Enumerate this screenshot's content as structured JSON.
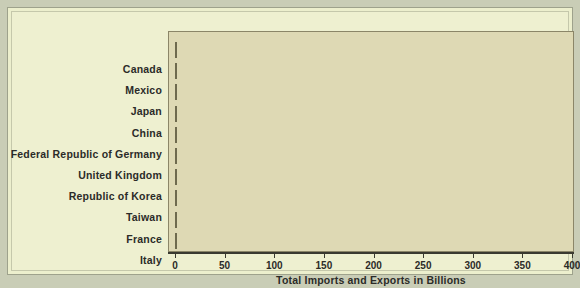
{
  "chart_data": {
    "type": "bar",
    "orientation": "horizontal",
    "title": "",
    "xlabel": "Total Imports and Exports in Billions",
    "ylabel": "",
    "xlim": [
      0,
      400
    ],
    "xticks": [
      0,
      50,
      100,
      150,
      200,
      250,
      300,
      350,
      400
    ],
    "grid": false,
    "legend": false,
    "categories": [
      "Canada",
      "Mexico",
      "Japan",
      "China",
      "Federal Republic of Germany",
      "United Kingdom",
      "Republic of Korea",
      "Taiwan",
      "France",
      "Italy"
    ],
    "values": [
      376,
      229,
      181,
      120,
      88,
      81,
      58,
      52,
      50,
      33
    ],
    "bars": [
      {
        "label": "Canada",
        "value": 376,
        "flag": "flag-canada"
      },
      {
        "label": "Mexico",
        "value": 229,
        "flag": "flag-mexico"
      },
      {
        "label": "Japan",
        "value": 181,
        "flag": "flag-japan"
      },
      {
        "label": "China",
        "value": 120,
        "flag": "flag-china"
      },
      {
        "label": "Federal Republic of Germany",
        "value": 88,
        "flag": "flag-germany"
      },
      {
        "label": "United Kingdom",
        "value": 81,
        "flag": "flag-united-kingdom"
      },
      {
        "label": "Republic of Korea",
        "value": 58,
        "flag": "flag-south-korea"
      },
      {
        "label": "Taiwan",
        "value": 52,
        "flag": "flag-taiwan"
      },
      {
        "label": "France",
        "value": 50,
        "flag": "flag-france"
      },
      {
        "label": "Italy",
        "value": 33,
        "flag": "flag-italy"
      }
    ]
  },
  "colors": {
    "page_background": "#c9cdb6",
    "card_background": "#eef0d0",
    "plot_background": "#ded9b4",
    "bar_red": "#e02e22",
    "bar_white": "#f2f2ef",
    "axis": "#3a3a30",
    "text": "#2b2b28"
  }
}
